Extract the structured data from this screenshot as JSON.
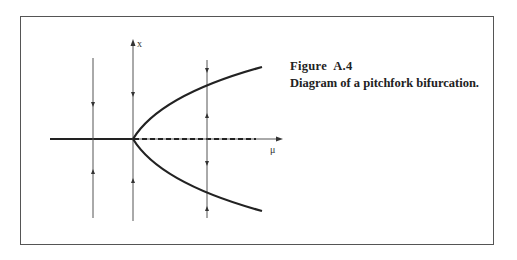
{
  "figure": {
    "label": "Figure  A.4",
    "caption": "Diagram of a pitchfork bifurcation."
  },
  "axes": {
    "x_label": "μ",
    "y_label": "x"
  },
  "colors": {
    "line": "#222222",
    "thin_line": "#555555",
    "frame": "#555555"
  },
  "diagram": {
    "branches": [
      {
        "name": "stable-branch-left",
        "style": "solid"
      },
      {
        "name": "unstable-branch-right",
        "style": "dashed"
      },
      {
        "name": "upper-stable-branch",
        "style": "solid"
      },
      {
        "name": "lower-stable-branch",
        "style": "solid"
      }
    ],
    "flow_lines": [
      {
        "position": "mu<0",
        "arrows": [
          "down-toward-axis",
          "up-toward-axis"
        ]
      },
      {
        "position": "mu=0",
        "arrows": [
          "down-toward-axis",
          "up-toward-axis"
        ]
      },
      {
        "position": "mu>0",
        "arrows": [
          "down-toward-upper",
          "up-toward-upper",
          "down-toward-lower",
          "up-toward-lower"
        ]
      }
    ]
  }
}
